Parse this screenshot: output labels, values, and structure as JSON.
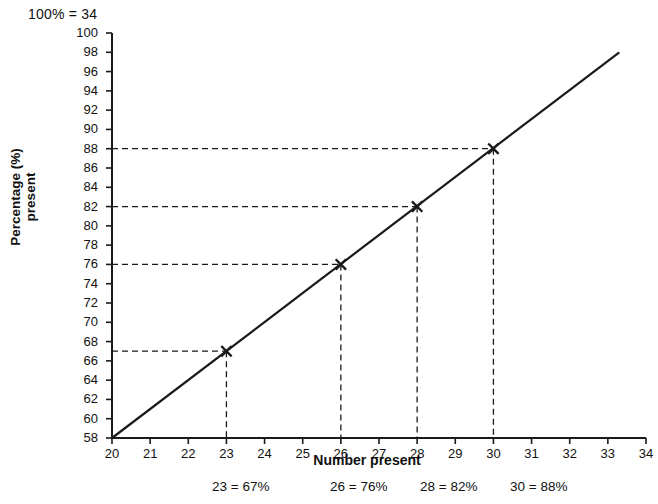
{
  "chart_data": {
    "type": "line",
    "title": "",
    "scale_note": "100% = 34",
    "xlabel": "Number present",
    "ylabel": "Percentage (%)\npresent",
    "xlim": [
      20,
      34
    ],
    "ylim": [
      58,
      100
    ],
    "xticks": [
      20,
      21,
      22,
      23,
      24,
      25,
      26,
      27,
      28,
      29,
      30,
      31,
      32,
      33,
      34
    ],
    "yticks": [
      58,
      60,
      62,
      64,
      66,
      68,
      70,
      72,
      74,
      76,
      78,
      80,
      82,
      84,
      86,
      88,
      90,
      92,
      94,
      96,
      98,
      100
    ],
    "grid": false,
    "legend": "none",
    "line": {
      "name": "conversion line",
      "x_start": 20,
      "y_start": 58,
      "x_end": 33.3,
      "y_end": 98,
      "color": "#1a1a1a"
    },
    "points": [
      {
        "x": 23,
        "y": 67,
        "marker": "cross",
        "label": "23 = 67%"
      },
      {
        "x": 26,
        "y": 76,
        "marker": "cross",
        "label": "26 = 76%"
      },
      {
        "x": 28,
        "y": 82,
        "marker": "cross",
        "label": "28 = 82%"
      },
      {
        "x": 30,
        "y": 88,
        "marker": "cross",
        "label": "30 = 88%"
      }
    ],
    "annotations": [
      {
        "text": "23 = 67%",
        "left": 212
      },
      {
        "text": "26 = 76%",
        "left": 330
      },
      {
        "text": "28 = 82%",
        "left": 420
      },
      {
        "text": "30 = 88%",
        "left": 510
      }
    ],
    "colors": {
      "line": "#1a1a1a",
      "axis": "#1a1a1a",
      "guide": "#1a1a1a",
      "text": "#111111",
      "background": "#ffffff"
    }
  }
}
